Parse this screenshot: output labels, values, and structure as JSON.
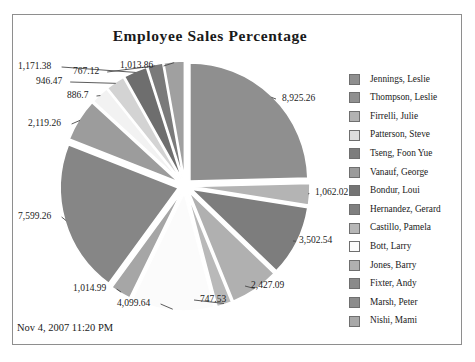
{
  "report": {
    "title": "Employee Sales Percentage",
    "timestamp": "Nov 4, 2007 11:20 PM",
    "frame_border_color": "#8e8e8e",
    "background_color": "#ffffff"
  },
  "chart_data": {
    "type": "pie",
    "title": "Employee Sales Percentage",
    "xlabel": "",
    "ylabel": "",
    "legend_position": "right",
    "grid": false,
    "exploded": true,
    "start_angle_deg": -90,
    "categories": [
      "Jennings, Leslie",
      "Thompson, Leslie",
      "Firrelli, Julie",
      "Patterson, Steve",
      "Tseng, Foon Yue",
      "Vanauf, George",
      "Bondur, Loui",
      "Hernandez, Gerard",
      "Castillo, Pamela",
      "Bott, Larry",
      "Jones, Barry",
      "Fixter, Andy",
      "Marsh, Peter",
      "Nishi, Mami"
    ],
    "values": [
      8925.26,
      1062.02,
      3502.54,
      2427.09,
      747.53,
      4099.64,
      1014.99,
      7599.26,
      2119.26,
      886.7,
      946.47,
      1171.38,
      767.12,
      1013.86
    ],
    "value_labels": [
      "8,925.26",
      "1,062.02",
      "3,502.54",
      "2,427.09",
      "747.53",
      "4,099.64",
      "1,014.99",
      "7,599.26",
      "2,119.26",
      "886.7",
      "946.47",
      "1,171.38",
      "767.12",
      "1,013.86"
    ],
    "slice_colors": [
      "#8f8f8f",
      "#b4b4b4",
      "#7d7d7d",
      "#b0b0b0",
      "#b9b9b9",
      "#fbfbfb",
      "#a6a6a6",
      "#868686",
      "#9c9c9c",
      "#f2f2f2",
      "#d3d3d3",
      "#6e6e6e",
      "#7a7a7a",
      "#a0a0a0"
    ]
  },
  "legend": {
    "items": [
      {
        "label": "Jennings, Leslie",
        "color": "#8f8f8f"
      },
      {
        "label": "Thompson, Leslie",
        "color": "#909090"
      },
      {
        "label": "Firrelli, Julie",
        "color": "#b2b2b2"
      },
      {
        "label": "Patterson, Steve",
        "color": "#dedede"
      },
      {
        "label": "Tseng, Foon Yue",
        "color": "#7d7d7d"
      },
      {
        "label": "Vanauf, George",
        "color": "#9b9b9b"
      },
      {
        "label": "Bondur, Loui",
        "color": "#747474"
      },
      {
        "label": "Hernandez, Gerard",
        "color": "#7f7f7f"
      },
      {
        "label": "Castillo, Pamela",
        "color": "#b6b6b6"
      },
      {
        "label": "Bott, Larry",
        "color": "#fbfbfb"
      },
      {
        "label": "Jones, Barry",
        "color": "#b0b0b0"
      },
      {
        "label": "Fixter, Andy",
        "color": "#8a8a8a"
      },
      {
        "label": "Marsh, Peter",
        "color": "#8c8c8c"
      },
      {
        "label": "Nishi, Mami",
        "color": "#a8a8a8"
      }
    ]
  },
  "callouts": [
    {
      "text": "8,925.26",
      "left": 282,
      "top": 94
    },
    {
      "text": "1,062.02",
      "left": 315,
      "top": 188
    },
    {
      "text": "3,502.54",
      "left": 299,
      "top": 236
    },
    {
      "text": "2,427.09",
      "left": 251,
      "top": 281
    },
    {
      "text": "747.53",
      "left": 200,
      "top": 295
    },
    {
      "text": "4,099.64",
      "left": 117,
      "top": 299
    },
    {
      "text": "1,014.99",
      "left": 73,
      "top": 284
    },
    {
      "text": "7,599.26",
      "left": 18,
      "top": 212
    },
    {
      "text": "2,119.26",
      "left": 28,
      "top": 119
    },
    {
      "text": "886.7",
      "left": 67,
      "top": 91
    },
    {
      "text": "946.47",
      "left": 36,
      "top": 77
    },
    {
      "text": "1,171.38",
      "left": 18,
      "top": 62
    },
    {
      "text": "767.12",
      "left": 73,
      "top": 67
    },
    {
      "text": "1,013.86",
      "left": 120,
      "top": 61
    }
  ]
}
